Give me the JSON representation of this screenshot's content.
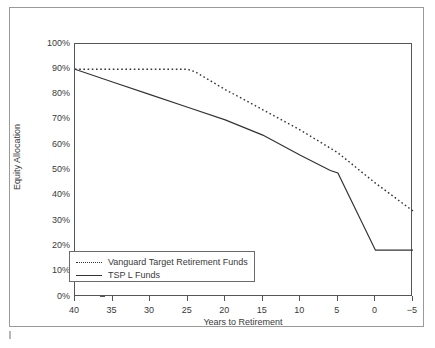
{
  "chart_data": {
    "type": "line",
    "title": "",
    "subtitle": "",
    "xlabel": "Years to Retirement",
    "ylabel": "Equity Allocation",
    "xlim": [
      40,
      -5
    ],
    "ylim": [
      0,
      100
    ],
    "x_reversed": true,
    "grid": false,
    "legend_position": "lower-left-inside",
    "x_ticks": [
      "40",
      "35",
      "30",
      "25",
      "20",
      "15",
      "10",
      "5",
      "0",
      "−5"
    ],
    "x_tick_values": [
      40,
      35,
      30,
      25,
      20,
      15,
      10,
      5,
      0,
      -5
    ],
    "y_ticks": [
      "0%",
      "10%",
      "20%",
      "30%",
      "40%",
      "50%",
      "60%",
      "70%",
      "80%",
      "90%",
      "100%"
    ],
    "y_tick_values": [
      0,
      10,
      20,
      30,
      40,
      50,
      60,
      70,
      80,
      90,
      100
    ],
    "y_unit": "%",
    "series": [
      {
        "name": "Vanguard Target Retirement Funds",
        "style": "dotted",
        "color": "#333333",
        "x": [
          40,
          35,
          30,
          25,
          24,
          20,
          15,
          10,
          5,
          0,
          -5
        ],
        "values": [
          90,
          90,
          90,
          90,
          89,
          82,
          74,
          66,
          57,
          45,
          34
        ]
      },
      {
        "name": "TSP L Funds",
        "style": "solid",
        "color": "#333333",
        "x": [
          40,
          35,
          30,
          25,
          20,
          15,
          10,
          6,
          5,
          0,
          -5
        ],
        "values": [
          90,
          85,
          80,
          75,
          70,
          64,
          56,
          50,
          49,
          18.5,
          18.5
        ]
      }
    ]
  },
  "legend": {
    "entries": [
      {
        "label": "Vanguard Target Retirement Funds",
        "style": "dotted"
      },
      {
        "label": "TSP L Funds",
        "style": "solid"
      }
    ]
  },
  "colors": {
    "line": "#333333",
    "axis": "#555555",
    "frame": "#9a9a9a",
    "text": "#3a3a3a",
    "background": "#ffffff"
  }
}
